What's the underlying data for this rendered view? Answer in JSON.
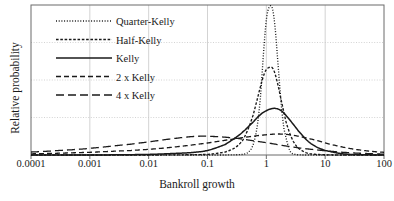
{
  "chart_data": {
    "type": "line",
    "title": "",
    "xlabel": "Bankroll growth",
    "ylabel": "Relative probability",
    "xscale": "log",
    "xlim": [
      0.0001,
      100
    ],
    "ylim": [
      0,
      1
    ],
    "grid": true,
    "x_ticks": [
      "0.0001",
      "0.001",
      "0.01",
      "0.1",
      "1",
      "10",
      "100"
    ],
    "x_tick_values": [
      0.0001,
      0.001,
      0.01,
      0.1,
      1,
      10,
      100
    ],
    "y_ticks": [],
    "y_gridlines": [
      0.25,
      0.5,
      0.75
    ],
    "legend_position": "upper-left",
    "series": [
      {
        "name": "Quarter-Kelly",
        "style": "dotted",
        "peak_x": 1.25,
        "peak_y": 0.985,
        "log_sigma": 0.135,
        "log_mu": 0.097,
        "x": [
          0.0001,
          0.001,
          0.01,
          0.1,
          0.2,
          0.4,
          0.5,
          0.6,
          0.7,
          0.8,
          0.9,
          1.0,
          1.1,
          1.25,
          1.4,
          1.6,
          1.8,
          2.0,
          2.5,
          3.0,
          4.0,
          6.0,
          10,
          30,
          100
        ],
        "y": [
          0.0,
          0.0,
          0.0,
          0.0,
          0.0,
          0.004,
          0.02,
          0.07,
          0.19,
          0.4,
          0.69,
          0.9,
          0.98,
          0.985,
          0.86,
          0.58,
          0.33,
          0.17,
          0.03,
          0.006,
          0.0,
          0.0,
          0.0,
          0.0,
          0.0
        ]
      },
      {
        "name": "Half-Kelly",
        "style": "dashed-short",
        "peak_x": 1.3,
        "peak_y": 0.585,
        "log_sigma": 0.26,
        "log_mu": 0.114,
        "x": [
          0.0001,
          0.001,
          0.01,
          0.1,
          0.2,
          0.3,
          0.4,
          0.5,
          0.6,
          0.7,
          0.8,
          0.9,
          1.0,
          1.15,
          1.3,
          1.5,
          1.8,
          2.2,
          2.8,
          3.5,
          5.0,
          8.0,
          15,
          40,
          100
        ],
        "y": [
          0.0,
          0.0,
          0.0,
          0.004,
          0.02,
          0.05,
          0.1,
          0.18,
          0.27,
          0.37,
          0.46,
          0.53,
          0.57,
          0.585,
          0.575,
          0.5,
          0.36,
          0.21,
          0.1,
          0.045,
          0.012,
          0.003,
          0.0,
          0.0,
          0.0
        ]
      },
      {
        "name": "Kelly",
        "style": "solid",
        "peak_x": 1.45,
        "peak_y": 0.31,
        "log_sigma": 0.5,
        "log_mu": 0.16,
        "x": [
          0.0001,
          0.001,
          0.01,
          0.05,
          0.1,
          0.2,
          0.3,
          0.4,
          0.6,
          0.8,
          1.0,
          1.2,
          1.45,
          1.8,
          2.2,
          2.8,
          3.5,
          5.0,
          7.0,
          10,
          20,
          40,
          100
        ],
        "y": [
          0.0,
          0.0,
          0.004,
          0.015,
          0.03,
          0.07,
          0.115,
          0.155,
          0.22,
          0.27,
          0.295,
          0.308,
          0.31,
          0.295,
          0.26,
          0.21,
          0.16,
          0.095,
          0.055,
          0.03,
          0.008,
          0.002,
          0.0
        ]
      },
      {
        "name": "2 x Kelly",
        "style": "dashed-medium",
        "peak_x": 1.6,
        "peak_y": 0.14,
        "log_sigma": 1.05,
        "log_mu": 0.1,
        "x": [
          0.0001,
          0.001,
          0.005,
          0.01,
          0.03,
          0.1,
          0.3,
          0.6,
          1.0,
          1.6,
          2.5,
          4.0,
          7.0,
          12,
          25,
          50,
          100
        ],
        "y": [
          0.008,
          0.018,
          0.03,
          0.038,
          0.055,
          0.08,
          0.108,
          0.125,
          0.135,
          0.14,
          0.135,
          0.12,
          0.098,
          0.072,
          0.045,
          0.028,
          0.018
        ]
      },
      {
        "name": "4 x Kelly",
        "style": "dashed-long",
        "peak_x": 0.07,
        "peak_y": 0.125,
        "log_sigma": 1.9,
        "log_mu": -1.15,
        "x": [
          0.0001,
          0.0005,
          0.001,
          0.005,
          0.01,
          0.03,
          0.07,
          0.15,
          0.3,
          0.6,
          1.0,
          2.0,
          4.0,
          8.0,
          20,
          50,
          100
        ],
        "y": [
          0.02,
          0.035,
          0.045,
          0.072,
          0.088,
          0.112,
          0.125,
          0.122,
          0.112,
          0.095,
          0.082,
          0.062,
          0.045,
          0.032,
          0.018,
          0.01,
          0.006
        ]
      }
    ]
  },
  "legend": {
    "items": [
      {
        "label": "Quarter-Kelly"
      },
      {
        "label": "Half-Kelly"
      },
      {
        "label": "Kelly"
      },
      {
        "label": "2 x Kelly"
      },
      {
        "label": "4 x Kelly"
      }
    ]
  },
  "colors": {
    "line": "#1a1a1a",
    "grid": "#c8c8c8",
    "frame": "#6b6b6b",
    "background": "#ffffff"
  }
}
